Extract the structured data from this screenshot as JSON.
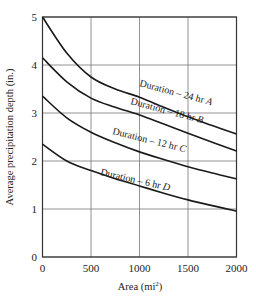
{
  "chart_data": {
    "type": "line",
    "title": "",
    "xlabel": "Area (mi²)",
    "xlabel_base": "Area (mi",
    "xlabel_sup": "2",
    "xlabel_close": ")",
    "ylabel": "Average precipitation depth (in.)",
    "xlim": [
      0,
      2000
    ],
    "ylim": [
      0,
      5
    ],
    "grid": true,
    "legend_position": "inline curve labels",
    "x_ticks": [
      "0",
      "500",
      "1000",
      "1500",
      "2000"
    ],
    "y_ticks": [
      "0",
      "1",
      "2",
      "3",
      "4",
      "5"
    ],
    "x": [
      0,
      250,
      500,
      750,
      1000,
      1250,
      1500,
      1750,
      2000
    ],
    "series": [
      {
        "name": "Duration – 24 hr A",
        "values": [
          5.0,
          4.25,
          3.75,
          3.5,
          3.33,
          3.12,
          2.92,
          2.74,
          2.56
        ]
      },
      {
        "name": "Duration – 18 hr B",
        "values": [
          4.15,
          3.65,
          3.31,
          3.12,
          2.96,
          2.77,
          2.58,
          2.39,
          2.21
        ]
      },
      {
        "name": "Duration – 12 hr C",
        "values": [
          3.35,
          2.9,
          2.6,
          2.38,
          2.19,
          2.03,
          1.88,
          1.75,
          1.63
        ]
      },
      {
        "name": "Duration – 6 hr D",
        "values": [
          2.35,
          2.0,
          1.8,
          1.63,
          1.48,
          1.33,
          1.19,
          1.07,
          0.96
        ]
      }
    ],
    "curve_labels": [
      {
        "text": "Duration – 24 hr ",
        "letter": "A"
      },
      {
        "text": "Duration – 18 hr ",
        "letter": "B"
      },
      {
        "text": "Duration – 12 hr ",
        "letter": "C"
      },
      {
        "text": "Duration – 6 hr ",
        "letter": "D"
      }
    ]
  }
}
